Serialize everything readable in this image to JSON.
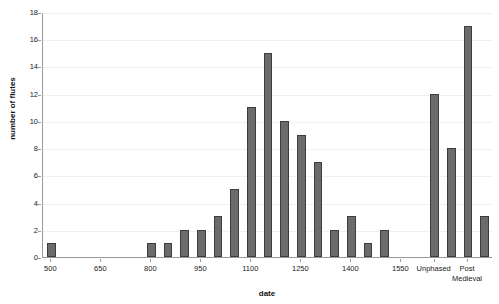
{
  "chart_data": {
    "type": "bar",
    "title": "",
    "xlabel": "date",
    "ylabel": "number of flutes",
    "ylim": [
      0,
      18
    ],
    "ytick_step": 2,
    "yticks": [
      0,
      2,
      4,
      6,
      8,
      10,
      12,
      14,
      16,
      18
    ],
    "grid": true,
    "legend": "none",
    "bar_color": "#6b6b6b",
    "bar_edge_color": "#3d3d3d",
    "xtick_labels": [
      "500",
      "650",
      "800",
      "950",
      "1100",
      "1250",
      "1400",
      "1550",
      "Unphased",
      "Post Medieval"
    ],
    "categories": [
      "500",
      "550",
      "600",
      "650",
      "700",
      "750",
      "800",
      "850",
      "900",
      "950",
      "1000",
      "1050",
      "1100",
      "1150",
      "1200",
      "1250",
      "1300",
      "1350",
      "1400",
      "1450",
      "1500",
      "1550",
      "1600",
      "Unphased",
      "U2",
      "Post Medieval",
      "PM2"
    ],
    "values": [
      1,
      0,
      0,
      0,
      0,
      0,
      1,
      1,
      2,
      2,
      3,
      5,
      11,
      15,
      10,
      9,
      7,
      2,
      3,
      1,
      2,
      0,
      0,
      12,
      8,
      17,
      3
    ]
  },
  "axes": {
    "y_title": "number of flutes",
    "x_title": "date"
  }
}
